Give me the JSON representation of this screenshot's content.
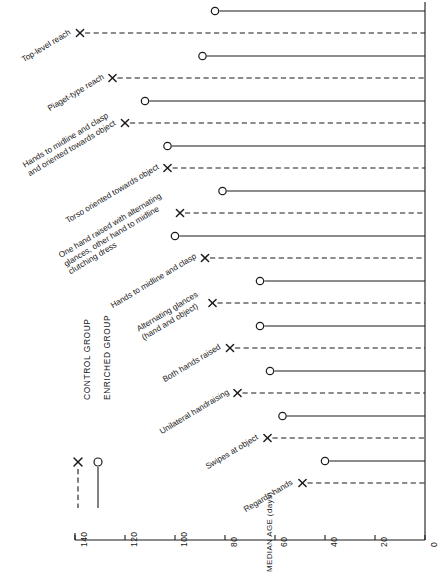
{
  "chart_data": {
    "type": "bar",
    "title": "",
    "subtitle": "",
    "xlabel": "MEDIAN AGE (days)",
    "ylabel": "",
    "orientation": "horizontal",
    "axis_ticks": [
      140,
      120,
      100,
      80,
      60,
      40,
      20,
      0
    ],
    "axis_range": [
      140,
      0
    ],
    "axis_reversed": true,
    "grid": false,
    "legend_position": "lower-left",
    "categories": [
      "Top-level reach",
      "Piaget-type reach",
      "Hands to midline and clasp and oriented towards object",
      "Torso oriented towards object",
      "One hand raised with alternating glances, other hand to midline clutching dress",
      "Hands to midline and clasp",
      "Alternating glances (hand and object)",
      "Both hands raised",
      "Unilateral handraising",
      "Swipes at object",
      "Regards hands"
    ],
    "category_lines": [
      [
        "Top-level reach"
      ],
      [
        "Piaget-type reach"
      ],
      [
        "Hands to midline and clasp",
        "and oriented towards object"
      ],
      [
        "Torso oriented towards object"
      ],
      [
        "One hand raised with alternating",
        "glances, other hand to midline",
        "clutching dress"
      ],
      [
        "Hands to midline and clasp"
      ],
      [
        "Alternating glances",
        "(hand and object)"
      ],
      [
        "Both hands raised"
      ],
      [
        "Unilateral handraising"
      ],
      [
        "Swipes at object"
      ],
      [
        "Regards hands"
      ]
    ],
    "series": [
      {
        "name": "ENRICHED GROUP",
        "marker": "circle",
        "line_style": "solid",
        "values": [
          84,
          89,
          112,
          103,
          81,
          100,
          66,
          66,
          62,
          57,
          40
        ]
      },
      {
        "name": "CONTROL GROUP",
        "marker": "x",
        "line_style": "dashed",
        "values": [
          138,
          125,
          120,
          103,
          98,
          88,
          85,
          78,
          75,
          63,
          49
        ]
      }
    ]
  },
  "legend": {
    "entries": [
      {
        "label": "CONTROL GROUP",
        "marker": "x-marker-icon",
        "line_style": "dashed"
      },
      {
        "label": "ENRICHED GROUP",
        "marker": "circle-marker-icon",
        "line_style": "solid"
      }
    ]
  },
  "axis": {
    "title": "MEDIAN AGE (days)",
    "tick_labels": [
      "140",
      "120",
      "100",
      "80",
      "60",
      "40",
      "20",
      "0"
    ]
  },
  "colors": {
    "ink": "#1a1a1a",
    "background": "#ffffff"
  }
}
